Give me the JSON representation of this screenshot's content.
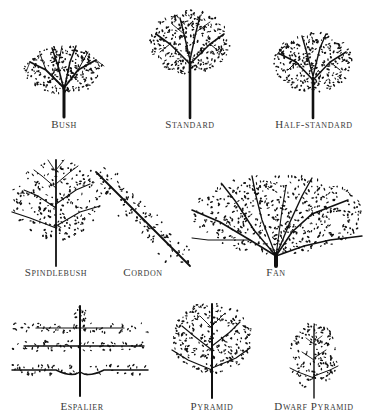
{
  "ink_color": "#111111",
  "label_color": "#3a3a3a",
  "rows": [
    {
      "forms": [
        {
          "id": "bush",
          "label": "Bush",
          "label_x": 64,
          "label_y": 118
        },
        {
          "id": "standard",
          "label": "Standard",
          "label_x": 190,
          "label_y": 118
        },
        {
          "id": "half-standard",
          "label": "Half-standard",
          "label_x": 314,
          "label_y": 118
        }
      ]
    },
    {
      "forms": [
        {
          "id": "spindlebush",
          "label": "Spindlebush",
          "label_x": 56,
          "label_y": 266
        },
        {
          "id": "cordon",
          "label": "Cordon",
          "label_x": 143,
          "label_y": 266
        },
        {
          "id": "fan",
          "label": "Fan",
          "label_x": 276,
          "label_y": 266
        }
      ]
    },
    {
      "forms": [
        {
          "id": "espalier",
          "label": "Espalier",
          "label_x": 82,
          "label_y": 400
        },
        {
          "id": "pyramid",
          "label": "Pyramid",
          "label_x": 212,
          "label_y": 400
        },
        {
          "id": "dwarf-pyramid",
          "label": "Dwarf Pyramid",
          "label_x": 314,
          "label_y": 400
        }
      ]
    }
  ]
}
